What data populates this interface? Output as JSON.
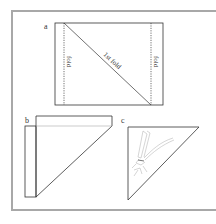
{
  "figure": {
    "frame_color": "#a8a8a8",
    "line_color": "#333333",
    "sketch_color": "#b8b8b8",
    "panels": {
      "a": {
        "label": "a",
        "fold_left": "fold",
        "fold_right": "fold",
        "diagonal": "1st fold"
      },
      "b": {
        "label": "b"
      },
      "c": {
        "label": "c",
        "sketch": "dragonfly"
      }
    }
  }
}
